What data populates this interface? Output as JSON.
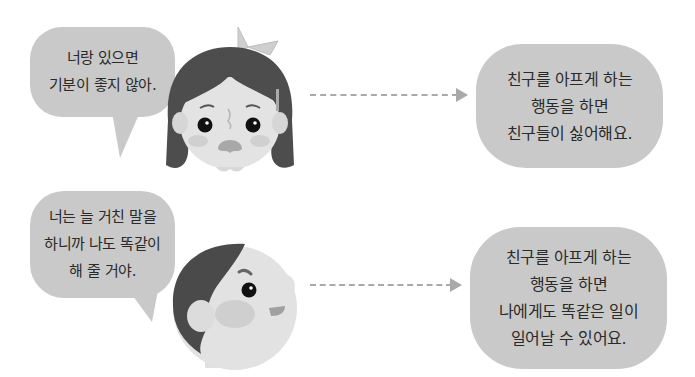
{
  "rows": [
    {
      "speaker": "girl",
      "speech": [
        "너랑 있으면",
        "기분이 좋지 않아."
      ],
      "result": [
        "친구를 아프게 하는",
        "행동을 하면",
        "친구들이 싫어해요."
      ]
    },
    {
      "speaker": "boy",
      "speech": [
        "너는 늘 거친 말을",
        "하니까 나도 똑같이",
        "해 줄 거야."
      ],
      "result": [
        "친구를 아프게 하는",
        "행동을 하면",
        "나에게도 똑같은 일이",
        "일어날 수 있어요."
      ]
    }
  ],
  "colors": {
    "bubble": "#c9c9c9",
    "arrow": "#a9a9a9",
    "hair": "#4a4a4a",
    "skin": "#e6e6e6",
    "text": "#2a2a2a"
  }
}
